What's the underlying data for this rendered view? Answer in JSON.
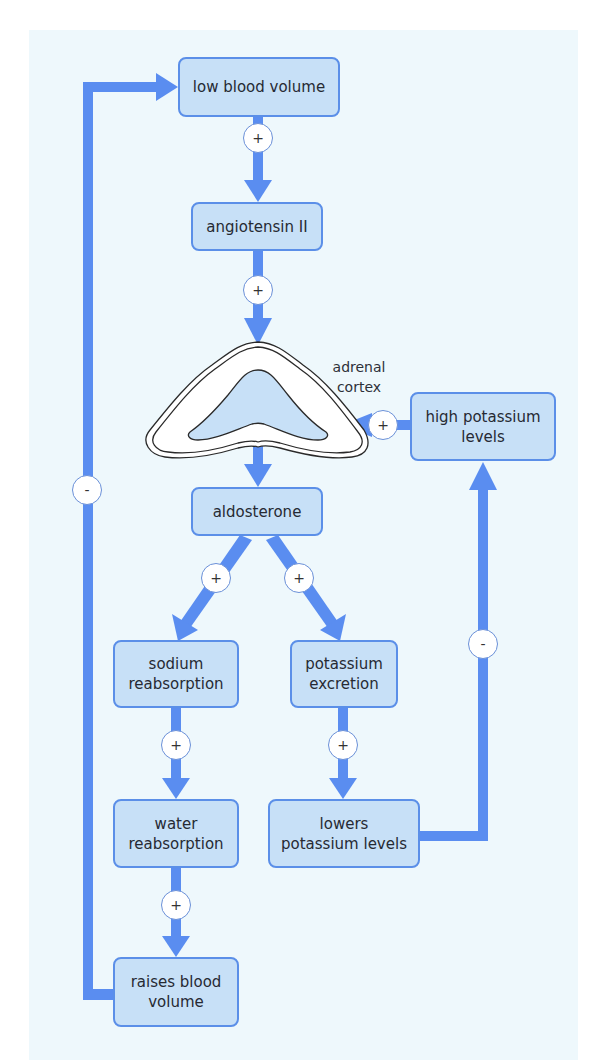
{
  "diagram": {
    "type": "feedback-flowchart",
    "colors": {
      "panel_bg": "#eef8fc",
      "node_fill": "#c7e0f7",
      "node_border": "#5b8fe8",
      "arrow": "#5a8df0",
      "gland_fill": "#c7e0f7"
    },
    "nodes": {
      "low_blood_volume": "low blood volume",
      "angiotensin": "angiotensin II",
      "aldosterone": "aldosterone",
      "high_potassium": "high potassium\nlevels",
      "sodium_reabsorption": "sodium\nreabsorption",
      "potassium_excretion": "potassium\nexcretion",
      "water_reabsorption": "water\nreabsorption",
      "lowers_potassium": "lowers\npotassium levels",
      "raises_blood_volume": "raises blood\nvolume"
    },
    "gland_label": "adrenal\ncortex",
    "signs": {
      "plus": "+",
      "minus": "-"
    },
    "edges": [
      {
        "from": "low blood volume",
        "to": "angiotensin II",
        "sign": "+"
      },
      {
        "from": "angiotensin II",
        "to": "adrenal cortex",
        "sign": "+"
      },
      {
        "from": "high potassium levels",
        "to": "adrenal cortex",
        "sign": "+"
      },
      {
        "from": "adrenal cortex",
        "to": "aldosterone",
        "sign": ""
      },
      {
        "from": "aldosterone",
        "to": "sodium reabsorption",
        "sign": "+"
      },
      {
        "from": "aldosterone",
        "to": "potassium excretion",
        "sign": "+"
      },
      {
        "from": "sodium reabsorption",
        "to": "water reabsorption",
        "sign": "+"
      },
      {
        "from": "potassium excretion",
        "to": "lowers potassium levels",
        "sign": "+"
      },
      {
        "from": "water reabsorption",
        "to": "raises blood volume",
        "sign": "+"
      },
      {
        "from": "raises blood volume",
        "to": "low blood volume",
        "sign": "-"
      },
      {
        "from": "lowers potassium levels",
        "to": "high potassium levels",
        "sign": "-"
      }
    ]
  }
}
